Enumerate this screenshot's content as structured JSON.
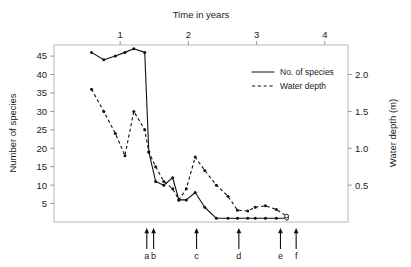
{
  "chart_data": {
    "type": "line",
    "title": "",
    "xlabel": "Time in years",
    "ylabel": "Number of species",
    "y2label": "Water depth (m)",
    "xlim": [
      0.03,
      4.34
    ],
    "ylim": [
      0,
      48
    ],
    "y2lim": [
      0,
      2.4
    ],
    "grid": false,
    "legend_position": "upper right",
    "xticks": [
      1,
      2,
      3,
      4
    ],
    "xticklabels": [
      "1",
      "2",
      "3",
      "4"
    ],
    "yticks": [
      5,
      10,
      15,
      20,
      25,
      30,
      35,
      40,
      45
    ],
    "yticklabels": [
      "5",
      "10",
      "15",
      "20",
      "25",
      "30",
      "35",
      "40",
      "45"
    ],
    "y2ticks": [
      0.5,
      1.0,
      1.5,
      2.0
    ],
    "y2ticklabels": [
      "0.5",
      "1.0",
      "1.5",
      "2.0"
    ],
    "series": [
      {
        "name": "No. of species",
        "style": "solid",
        "axis": "left",
        "x": [
          0.58,
          0.76,
          0.93,
          1.07,
          1.2,
          1.36,
          1.42,
          1.52,
          1.64,
          1.77,
          1.86,
          1.97,
          2.1,
          2.24,
          2.41,
          2.58,
          2.72,
          2.87,
          2.98,
          3.13,
          3.29,
          3.44
        ],
        "y": [
          46,
          44,
          45,
          46,
          47,
          46,
          19,
          11,
          10,
          12,
          6,
          6,
          8,
          4,
          1,
          1,
          1,
          1,
          1,
          1,
          1,
          1
        ]
      },
      {
        "name": "Water depth",
        "style": "dashed",
        "axis": "right",
        "x": [
          0.58,
          0.76,
          0.93,
          1.07,
          1.2,
          1.36,
          1.42,
          1.52,
          1.64,
          1.77,
          1.86,
          1.97,
          2.1,
          2.24,
          2.41,
          2.58,
          2.72,
          2.87,
          2.98,
          3.13,
          3.29,
          3.44
        ],
        "y": [
          1.8,
          1.5,
          1.2,
          0.9,
          1.5,
          1.25,
          0.95,
          0.75,
          0.55,
          0.45,
          0.3,
          0.45,
          0.88,
          0.7,
          0.5,
          0.35,
          0.16,
          0.15,
          0.2,
          0.22,
          0.17,
          0.08
        ]
      }
    ],
    "annotations": [
      {
        "label": "a",
        "x": 1.39
      },
      {
        "label": "b",
        "x": 1.49
      },
      {
        "label": "c",
        "x": 2.12
      },
      {
        "label": "d",
        "x": 2.74
      },
      {
        "label": "e",
        "x": 3.35
      },
      {
        "label": "f",
        "x": 3.58
      }
    ],
    "colors": {
      "line": "#111111",
      "frame": "#b9b9b9",
      "text": "#1a1a1a"
    }
  },
  "legend": {
    "entries": [
      {
        "label": "No. of species",
        "style": "solid"
      },
      {
        "label": "Water depth",
        "style": "dashed"
      }
    ]
  }
}
